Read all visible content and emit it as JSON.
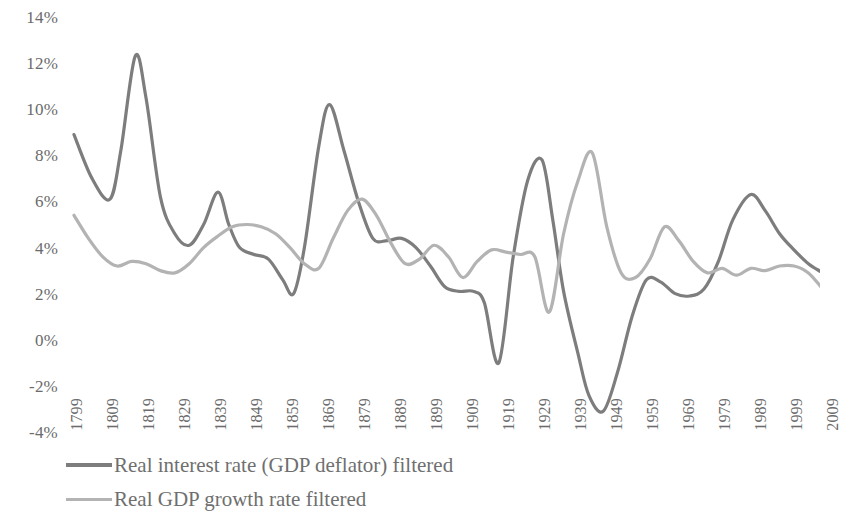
{
  "chart_data": {
    "type": "line",
    "title": "",
    "subtitle": "",
    "xlabel": "",
    "ylabel": "",
    "xlim": [
      1794,
      2014
    ],
    "ylim": [
      -4,
      14
    ],
    "y_tick_labels": [
      "14%",
      "12%",
      "10%",
      "8%",
      "6%",
      "4%",
      "2%",
      "0%",
      "-2%",
      "-4%"
    ],
    "y_tick_values": [
      14,
      12,
      10,
      8,
      6,
      4,
      2,
      0,
      -2,
      -4
    ],
    "x_tick_labels": [
      "1799",
      "1809",
      "1819",
      "1829",
      "1839",
      "1849",
      "1859",
      "1869",
      "1879",
      "1889",
      "1899",
      "1909",
      "1919",
      "1929",
      "1939",
      "1949",
      "1959",
      "1969",
      "1979",
      "1989",
      "1999",
      "2009"
    ],
    "x_tick_values": [
      1799,
      1809,
      1819,
      1829,
      1839,
      1849,
      1859,
      1869,
      1879,
      1889,
      1899,
      1909,
      1919,
      1929,
      1939,
      1949,
      1959,
      1969,
      1979,
      1989,
      1999,
      2009
    ],
    "grid": false,
    "legend_position": "bottom-left",
    "colors": {
      "real_interest_rate": "#7d7d7d",
      "real_gdp_growth": "#b3b3b3",
      "axis_text": "#6b6b6b",
      "background": "#ffffff"
    },
    "series": [
      {
        "name": "Real interest rate (GDP deflator) filtered",
        "color": "#7d7d7d",
        "x": [
          1799,
          1804,
          1809,
          1812,
          1816,
          1819,
          1823,
          1827,
          1831,
          1835,
          1839,
          1842,
          1845,
          1849,
          1853,
          1857,
          1860,
          1863,
          1867,
          1870,
          1874,
          1878,
          1882,
          1886,
          1890,
          1894,
          1898,
          1902,
          1906,
          1910,
          1913,
          1917,
          1921,
          1925,
          1929,
          1932,
          1935,
          1939,
          1942,
          1946,
          1950,
          1954,
          1958,
          1962,
          1966,
          1970,
          1974,
          1978,
          1982,
          1987,
          1991,
          1995,
          1999,
          2003,
          2007,
          2011
        ],
        "values": [
          8.9,
          7.0,
          6.1,
          8.2,
          12.3,
          10.5,
          6.2,
          4.6,
          4.1,
          5.0,
          6.4,
          5.0,
          4.0,
          3.7,
          3.5,
          2.6,
          2.0,
          4.0,
          8.4,
          10.2,
          8.2,
          6.0,
          4.4,
          4.3,
          4.4,
          4.0,
          3.2,
          2.3,
          2.1,
          2.1,
          1.6,
          -1.0,
          3.6,
          6.9,
          7.8,
          5.2,
          2.1,
          -0.6,
          -2.4,
          -3.1,
          -1.4,
          1.0,
          2.6,
          2.5,
          2.0,
          1.9,
          2.2,
          3.4,
          5.2,
          6.3,
          5.6,
          4.6,
          3.9,
          3.3,
          2.9,
          2.5
        ]
      },
      {
        "name": "Real GDP growth rate filtered",
        "color": "#b3b3b3",
        "x": [
          1799,
          1803,
          1807,
          1811,
          1815,
          1819,
          1823,
          1827,
          1831,
          1835,
          1839,
          1843,
          1847,
          1851,
          1855,
          1859,
          1863,
          1867,
          1871,
          1875,
          1879,
          1883,
          1887,
          1891,
          1895,
          1899,
          1903,
          1907,
          1911,
          1915,
          1919,
          1923,
          1927,
          1931,
          1935,
          1939,
          1943,
          1947,
          1951,
          1955,
          1959,
          1963,
          1967,
          1971,
          1975,
          1979,
          1983,
          1987,
          1991,
          1995,
          1999,
          2003,
          2007,
          2011
        ],
        "values": [
          5.4,
          4.4,
          3.6,
          3.2,
          3.4,
          3.3,
          3.0,
          2.9,
          3.3,
          4.0,
          4.5,
          4.9,
          5.0,
          4.9,
          4.6,
          4.0,
          3.3,
          3.1,
          4.4,
          5.6,
          6.1,
          5.4,
          4.2,
          3.3,
          3.5,
          4.1,
          3.6,
          2.7,
          3.4,
          3.9,
          3.8,
          3.7,
          3.6,
          1.2,
          4.6,
          6.9,
          8.1,
          4.9,
          2.9,
          2.7,
          3.5,
          4.9,
          4.3,
          3.4,
          2.9,
          3.1,
          2.8,
          3.1,
          3.0,
          3.2,
          3.2,
          2.9,
          2.2,
          1.5
        ]
      }
    ]
  },
  "legend": {
    "items": [
      {
        "label": "Real interest rate (GDP deflator) filtered",
        "color": "#7d7d7d"
      },
      {
        "label": "Real GDP growth rate filtered",
        "color": "#b3b3b3"
      }
    ]
  }
}
